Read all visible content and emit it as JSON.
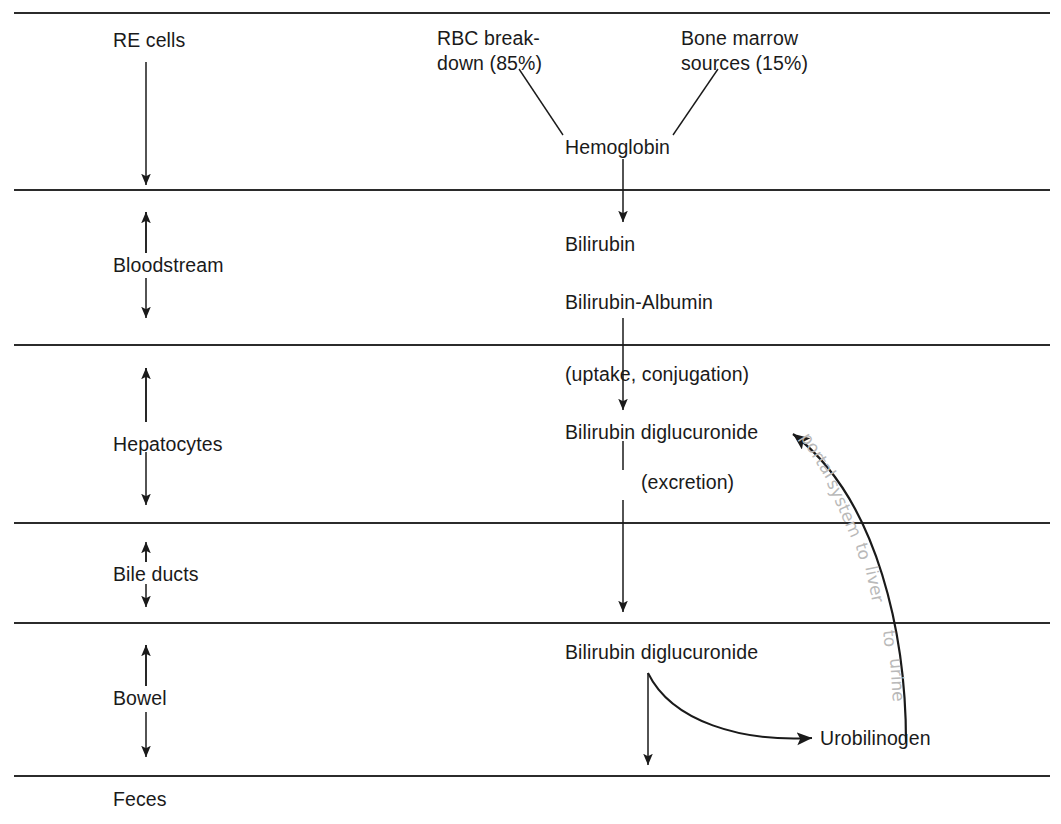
{
  "figure": {
    "type": "flow-diagram",
    "title_partial": "",
    "background_color": "#ffffff",
    "ink_color": "#1a1a1a",
    "annotation_color": "#b9b9b9"
  },
  "compartments": [
    {
      "label": "RE cells",
      "arrow": "down"
    },
    {
      "label": "Bloodstream",
      "arrow": "double"
    },
    {
      "label": "Hepatocytes",
      "arrow": "double"
    },
    {
      "label": "Bile ducts",
      "arrow": "double"
    },
    {
      "label": "Bowel",
      "arrow": "double"
    },
    {
      "label": "Feces",
      "arrow": "none"
    }
  ],
  "sources": {
    "rbc_line1": "RBC break-",
    "rbc_line2": "down (85%)",
    "marrow_line1": "Bone marrow",
    "marrow_line2": "sources (15%)"
  },
  "pathway": {
    "hemoglobin": "Hemoglobin",
    "bilirubin": "Bilirubin",
    "bilirubin_albumin": "Bilirubin-Albumin",
    "uptake_conjugation": "(uptake, conjugation)",
    "bilirubin_diglucuronide_liver": "Bilirubin diglucuronide",
    "excretion": "(excretion)",
    "bilirubin_diglucuronide_bowel": "Bilirubin diglucuronide",
    "urobilinogen": "Urobilinogen"
  },
  "annotation": {
    "full_text": "portal system to liver to urine",
    "words": [
      {
        "text": "portal",
        "x": 805,
        "y": 424,
        "rot": 58
      },
      {
        "text": "system",
        "x": 832,
        "y": 470,
        "rot": 66
      },
      {
        "text": "to",
        "x": 861,
        "y": 533,
        "rot": 74
      },
      {
        "text": "liver",
        "x": 871,
        "y": 556,
        "rot": 78
      },
      {
        "text": "to",
        "x": 889,
        "y": 620,
        "rot": 84
      },
      {
        "text": "urine",
        "x": 896,
        "y": 648,
        "rot": 86
      }
    ]
  },
  "rules_y": [
    13,
    190,
    345,
    523,
    623,
    776
  ]
}
